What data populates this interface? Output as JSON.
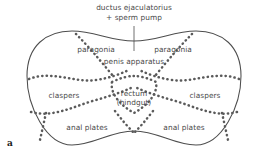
{
  "figure": {
    "panel_letter": "a",
    "outline_color": "#4d4d4d",
    "dotted_color": "#5a5a5a",
    "text_color": "#4a4a4a",
    "background_color": "#ffffff",
    "leader_line_color": "#4d4d4d"
  },
  "labels": {
    "title_line1": "ductus ejaculatorius",
    "title_line2": "+ sperm pump",
    "paragonia_left": "paragonia",
    "paragonia_right": "paragonia",
    "penis_apparatus": "penis apparatus",
    "claspers_left": "claspers",
    "claspers_right": "claspers",
    "rectum_line1": "rectum",
    "rectum_line2": "(hindgut)",
    "anal_plates_left": "anal plates",
    "anal_plates_right": "anal plates"
  }
}
